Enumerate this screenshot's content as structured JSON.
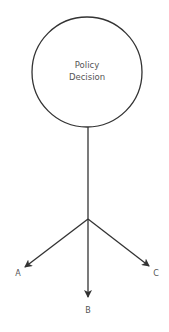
{
  "diagram": {
    "node": {
      "line1": "Policy",
      "line2": "Decision"
    },
    "branches": [
      {
        "label": "A"
      },
      {
        "label": "B"
      },
      {
        "label": "C"
      }
    ],
    "colors": {
      "stroke": "#333333",
      "text": "#555555"
    }
  }
}
